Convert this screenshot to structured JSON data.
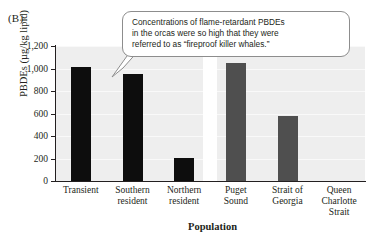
{
  "figure": {
    "panel_label": "(B)",
    "callout": {
      "lines": [
        "Concentrations of flame-retardant PBDEs",
        "in the orcas were so high that they were",
        "referred to as “fireproof killer whales.”"
      ],
      "full_text": "Concentrations of flame-retardant PBDEs in the orcas were so high that they were referred to as “fireproof killer whales.”",
      "border_color": "#8d8d8d",
      "background_color": "#ffffff"
    }
  },
  "chart_data": {
    "type": "bar",
    "title": "",
    "xlabel": "Population",
    "ylabel": "PBDEs (µg/kg lipid)",
    "categories": [
      "Transient",
      "Southern resident",
      "Northern resident",
      "Puget Sound",
      "Strait of Georgia",
      "Queen Charlotte Strait"
    ],
    "category_lines": [
      [
        "Transient"
      ],
      [
        "Southern",
        "resident"
      ],
      [
        "Northern",
        "resident"
      ],
      [
        "Puget",
        "Sound"
      ],
      [
        "Strait of",
        "Georgia"
      ],
      [
        "Queen",
        "Charlotte",
        "Strait"
      ]
    ],
    "values": [
      1010,
      950,
      205,
      1050,
      580,
      0
    ],
    "bar_colors": [
      "#0d0d0d",
      "#0d0d0d",
      "#0d0d0d",
      "#4f4f4f",
      "#4f4f4f",
      "#4f4f4f"
    ],
    "ylim": [
      0,
      1200
    ],
    "yticks": [
      0,
      200,
      400,
      600,
      800,
      1000,
      1200
    ],
    "ytick_labels": [
      "0",
      "200",
      "400",
      "600",
      "800",
      "1,000",
      "1,200"
    ],
    "grid": true,
    "grid_color": "#f9f9f9",
    "plot_background": "#eeeeee",
    "legend": "none",
    "group_separator_after_index": 2
  }
}
